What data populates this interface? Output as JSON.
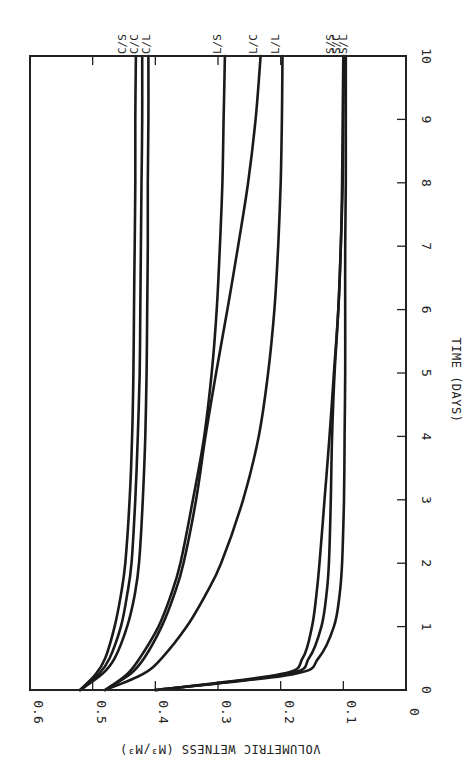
{
  "chart_data": {
    "type": "line",
    "orientation": "rotated-90-clockwise (time runs bottom-to-top, wetness runs right-to-left)",
    "title": "",
    "xlabel": "TIME (DAYS)",
    "ylabel": "VOLUMETRIC WETNESS (M³/M³)",
    "xlim": [
      0,
      10
    ],
    "ylim": [
      0,
      0.6
    ],
    "x_ticks": [
      "0",
      "1",
      "2",
      "3",
      "4",
      "5",
      "6",
      "7",
      "8",
      "9",
      "10"
    ],
    "y_ticks": [
      "0",
      "0.1",
      "0.2",
      "0.3",
      "0.4",
      "0.5",
      "0.6"
    ],
    "grid": false,
    "legend": "inline labels at t=10",
    "x": [
      0,
      0.25,
      0.5,
      1,
      1.5,
      2,
      3,
      4,
      5,
      6,
      7,
      8,
      9,
      10
    ],
    "series": [
      {
        "name": "C/S",
        "values": [
          0.52,
          0.495,
          0.48,
          0.465,
          0.455,
          0.448,
          0.441,
          0.437,
          0.435,
          0.434,
          0.433,
          0.432,
          0.432,
          0.431
        ]
      },
      {
        "name": "C/C",
        "values": [
          0.52,
          0.49,
          0.473,
          0.455,
          0.445,
          0.438,
          0.432,
          0.428,
          0.425,
          0.424,
          0.423,
          0.422,
          0.421,
          0.421
        ]
      },
      {
        "name": "C/L",
        "values": [
          0.52,
          0.485,
          0.465,
          0.445,
          0.433,
          0.426,
          0.42,
          0.416,
          0.414,
          0.413,
          0.412,
          0.412,
          0.411,
          0.411
        ]
      },
      {
        "name": "L/S",
        "values": [
          0.48,
          0.445,
          0.425,
          0.395,
          0.375,
          0.36,
          0.34,
          0.322,
          0.31,
          0.302,
          0.297,
          0.293,
          0.291,
          0.289
        ]
      },
      {
        "name": "L/C",
        "values": [
          0.48,
          0.44,
          0.418,
          0.39,
          0.37,
          0.355,
          0.335,
          0.32,
          0.303,
          0.285,
          0.268,
          0.252,
          0.24,
          0.232
        ]
      },
      {
        "name": "L/L",
        "values": [
          0.48,
          0.42,
          0.39,
          0.35,
          0.32,
          0.295,
          0.26,
          0.235,
          0.22,
          0.21,
          0.204,
          0.2,
          0.198,
          0.197
        ]
      },
      {
        "name": "S/S",
        "values": [
          0.4,
          0.2,
          0.165,
          0.15,
          0.143,
          0.138,
          0.13,
          0.122,
          0.115,
          0.108,
          0.104,
          0.102,
          0.101,
          0.1
        ]
      },
      {
        "name": "S/C",
        "values": [
          0.4,
          0.19,
          0.155,
          0.135,
          0.127,
          0.123,
          0.12,
          0.118,
          0.114,
          0.108,
          0.104,
          0.101,
          0.1,
          0.099
        ]
      },
      {
        "name": "S/L",
        "values": [
          0.4,
          0.18,
          0.14,
          0.115,
          0.106,
          0.102,
          0.099,
          0.098,
          0.097,
          0.097,
          0.097,
          0.096,
          0.096,
          0.096
        ]
      }
    ]
  }
}
